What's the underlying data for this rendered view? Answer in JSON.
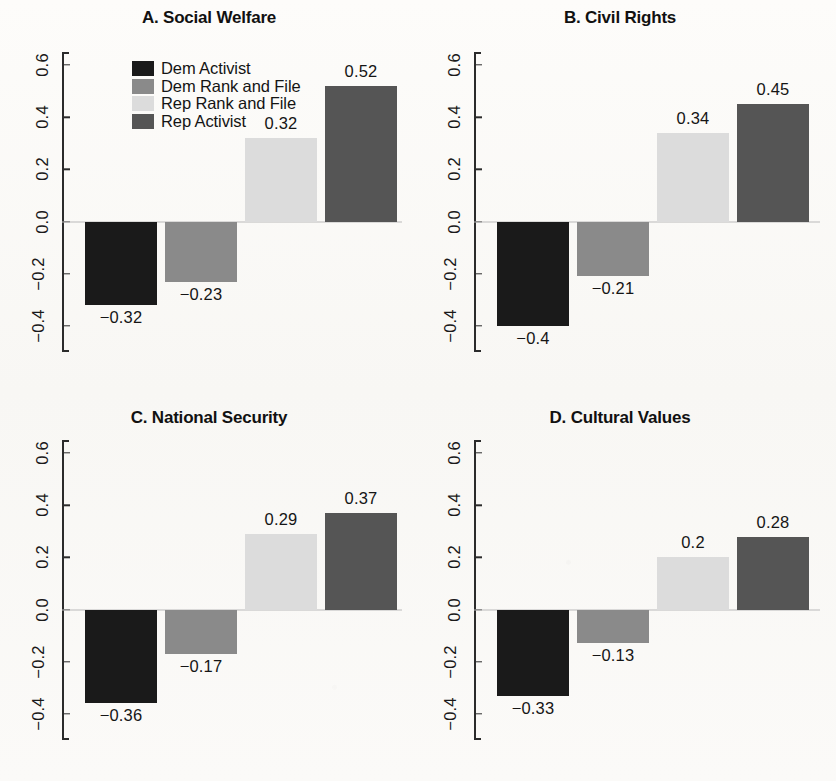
{
  "figure": {
    "background": "#fbfaf8",
    "axis_color": "#2b2b2b",
    "zero_line_color": "#b9b9b9"
  },
  "legend": {
    "position": "top-left of panel A",
    "items": [
      {
        "label": "Dem Activist",
        "color": "#1a1a1a"
      },
      {
        "label": "Dem Rank and File",
        "color": "#8a8a8a"
      },
      {
        "label": "Rep Rank and File",
        "color": "#dcdcdc"
      },
      {
        "label": "Rep Activist",
        "color": "#555555"
      }
    ]
  },
  "axis": {
    "ticks": [
      "0.6",
      "0.4",
      "0.2",
      "0.0",
      "−0.2",
      "−0.4"
    ],
    "tick_values": [
      0.6,
      0.4,
      0.2,
      0.0,
      -0.2,
      -0.4
    ],
    "ylim": [
      -0.5,
      0.65
    ]
  },
  "chart_data": [
    {
      "type": "bar",
      "panel": "A",
      "title": "A. Social Welfare",
      "xlabel": "",
      "ylabel": "",
      "ylim": [
        -0.5,
        0.65
      ],
      "grid": false,
      "legend_position": "top-left",
      "categories": [
        "Dem Activist",
        "Dem Rank and File",
        "Rep Rank and File",
        "Rep Activist"
      ],
      "values": [
        -0.32,
        -0.23,
        0.32,
        0.52
      ],
      "labels": [
        "−0.32",
        "−0.23",
        "0.32",
        "0.52"
      ],
      "colors": [
        "#1a1a1a",
        "#8a8a8a",
        "#dcdcdc",
        "#555555"
      ]
    },
    {
      "type": "bar",
      "panel": "B",
      "title": "B. Civil Rights",
      "xlabel": "",
      "ylabel": "",
      "ylim": [
        -0.5,
        0.65
      ],
      "grid": false,
      "legend_position": "none",
      "categories": [
        "Dem Activist",
        "Dem Rank and File",
        "Rep Rank and File",
        "Rep Activist"
      ],
      "values": [
        -0.4,
        -0.21,
        0.34,
        0.45
      ],
      "labels": [
        "−0.4",
        "−0.21",
        "0.34",
        "0.45"
      ],
      "colors": [
        "#1a1a1a",
        "#8a8a8a",
        "#dcdcdc",
        "#555555"
      ]
    },
    {
      "type": "bar",
      "panel": "C",
      "title": "C. National Security",
      "xlabel": "",
      "ylabel": "",
      "ylim": [
        -0.5,
        0.65
      ],
      "grid": false,
      "legend_position": "none",
      "categories": [
        "Dem Activist",
        "Dem Rank and File",
        "Rep Rank and File",
        "Rep Activist"
      ],
      "values": [
        -0.36,
        -0.17,
        0.29,
        0.37
      ],
      "labels": [
        "−0.36",
        "−0.17",
        "0.29",
        "0.37"
      ],
      "colors": [
        "#1a1a1a",
        "#8a8a8a",
        "#dcdcdc",
        "#555555"
      ]
    },
    {
      "type": "bar",
      "panel": "D",
      "title": "D. Cultural Values",
      "xlabel": "",
      "ylabel": "",
      "ylim": [
        -0.5,
        0.65
      ],
      "grid": false,
      "legend_position": "none",
      "categories": [
        "Dem Activist",
        "Dem Rank and File",
        "Rep Rank and File",
        "Rep Activist"
      ],
      "values": [
        -0.33,
        -0.13,
        0.2,
        0.28
      ],
      "labels": [
        "−0.33",
        "−0.13",
        "0.2",
        "0.28"
      ],
      "colors": [
        "#1a1a1a",
        "#8a8a8a",
        "#dcdcdc",
        "#555555"
      ]
    }
  ]
}
